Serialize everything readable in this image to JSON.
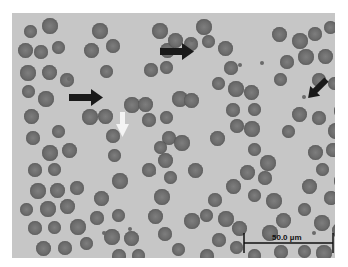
{
  "image": {
    "type": "light micrograph",
    "subject": "red blood cells (erythrocytes) in smear",
    "background_color": "#c6c6c6",
    "cell_color": "#6e6e6e"
  },
  "annotations": {
    "black_arrows": 3,
    "white_arrows": 1,
    "scale_bar": {
      "label": "50.0 µm"
    }
  }
}
